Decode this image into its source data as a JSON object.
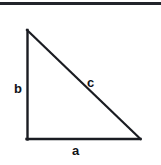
{
  "figure": {
    "background_color": "#ffffff",
    "stroke_color": "#1a1c22",
    "label_color": "#111318",
    "top_rule": {
      "present": true,
      "color": "#22242a"
    },
    "triangle": {
      "type": "right-triangle",
      "right_angle_at": "bottom-left",
      "vertices": {
        "top_left": [
          27,
          30
        ],
        "bottom_left": [
          27,
          139
        ],
        "bottom_right": [
          140,
          139
        ]
      },
      "stroke_width": 2
    },
    "labels": {
      "vertical_leg": "b",
      "horizontal_leg": "a",
      "hypotenuse": "c"
    }
  }
}
